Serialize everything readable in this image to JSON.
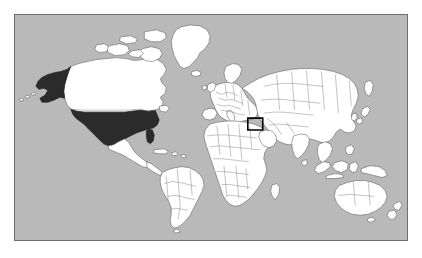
{
  "figure": {
    "kind": "world-map",
    "projection": "equirectangular",
    "background_color": "#ffffff",
    "caption": ""
  },
  "map": {
    "frame": {
      "x": 14,
      "y": 14,
      "width": 394,
      "height": 227,
      "border_color": "#6f6f6f",
      "border_width_px": 1
    },
    "ocean_color": "#b9b9b9",
    "land_color": "#ffffff",
    "land_border_color": "#5c5c5c",
    "country_border_color": "#7a7a7a",
    "highlight_fill_color": "#2b2b2b",
    "highlight_box_color": "#000000",
    "extent": {
      "lon_min": -180,
      "lon_max": 180,
      "lat_min": -58,
      "lat_max": 84
    },
    "highlighted_countries": [
      {
        "name": "United States (contiguous)",
        "style": "filled-dark"
      },
      {
        "name": "United States (Alaska)",
        "style": "filled-dark"
      }
    ],
    "inset_box": {
      "name": "levant-highlight-box",
      "label": "",
      "region": "Israel / Levant",
      "x": 248,
      "y": 118,
      "width": 15,
      "height": 12,
      "stroke_color": "#000000"
    },
    "labels": [],
    "legend": null,
    "landmasses": [
      "North America",
      "South America",
      "Greenland",
      "Europe",
      "Africa",
      "Asia",
      "Australia",
      "New Zealand",
      "Japan",
      "Indonesia",
      "Madagascar",
      "British Isles",
      "Iceland"
    ]
  }
}
